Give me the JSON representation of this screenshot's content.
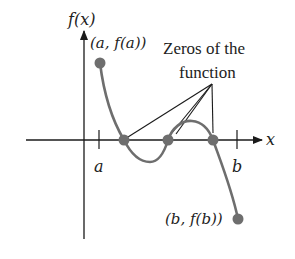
{
  "diagram": {
    "type": "function-graph",
    "y_axis_label": "f(x)",
    "x_axis_label": "x",
    "tick_labels": {
      "a": "a",
      "b": "b"
    },
    "point_labels": {
      "start": "(a, f(a))",
      "end": "(b, f(b))"
    },
    "annotation": {
      "line1": "Zeros of the",
      "line2": "function"
    },
    "zeros_count": 3,
    "colors": {
      "curve": "#6e6e6e",
      "points": "#6e6e6e",
      "axes": "#1a1a1a",
      "callout_lines": "#1a1a1a"
    }
  }
}
